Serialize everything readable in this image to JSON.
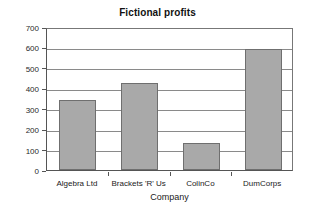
{
  "chart_data": {
    "type": "bar",
    "title": "Fictional profits",
    "xlabel": "Company",
    "ylabel": "Profit (£ millions)",
    "categories": [
      "Algebra Ltd",
      "Brackets 'R' Us",
      "ColinCo",
      "DumCorps"
    ],
    "values": [
      345,
      425,
      130,
      590
    ],
    "ylim": [
      0,
      700
    ],
    "ytick_values": [
      0,
      100,
      200,
      300,
      400,
      500,
      600,
      700
    ],
    "ytick_labels": [
      "0",
      "100",
      "200",
      "300",
      "400",
      "500",
      "600",
      "700"
    ],
    "grid": "horizontal",
    "legend": null,
    "series": [
      {
        "name": "Profit",
        "values": [
          345,
          425,
          130,
          590
        ],
        "bar_color": "#a9a9a9",
        "bar_edge_color": "#6f6f6f"
      }
    ],
    "colors": {
      "background": "#ffffff",
      "bar_fill": "#a9a9a9",
      "bar_edge": "#6f6f6f",
      "gridline": "#8a8a8a",
      "axis": "#555555",
      "text": "#1a1a1a"
    }
  }
}
